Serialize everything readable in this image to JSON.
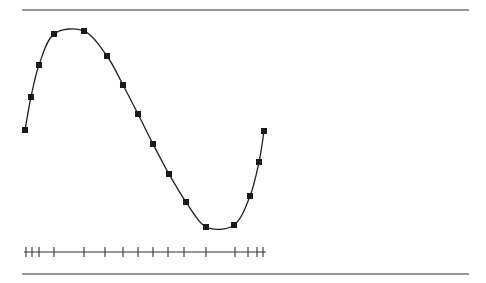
{
  "chart_data": {
    "type": "line",
    "title": "",
    "xlabel": "",
    "ylabel": "",
    "grid": false,
    "legend": null,
    "points_px": [
      {
        "x": 25,
        "y": 130
      },
      {
        "x": 31,
        "y": 97
      },
      {
        "x": 39,
        "y": 65
      },
      {
        "x": 54,
        "y": 34
      },
      {
        "x": 84,
        "y": 31
      },
      {
        "x": 107,
        "y": 56
      },
      {
        "x": 123,
        "y": 85
      },
      {
        "x": 138,
        "y": 114
      },
      {
        "x": 153,
        "y": 144
      },
      {
        "x": 169,
        "y": 174
      },
      {
        "x": 186,
        "y": 202
      },
      {
        "x": 206,
        "y": 227
      },
      {
        "x": 234,
        "y": 225
      },
      {
        "x": 250,
        "y": 196
      },
      {
        "x": 259,
        "y": 162
      },
      {
        "x": 264,
        "y": 131
      }
    ],
    "x_ticks_px": [
      26,
      32,
      39,
      54,
      84,
      105,
      123,
      138,
      153,
      168,
      184,
      206,
      235,
      248,
      257,
      263
    ],
    "x_tick_labels": [],
    "curve_extrema_px": {
      "max": {
        "x": 69,
        "y": 23
      },
      "min": {
        "x": 221,
        "y": 233
      }
    },
    "normalized_values": [
      0.0,
      0.32,
      0.62,
      0.91,
      0.94,
      0.7,
      0.43,
      0.15,
      -0.14,
      -0.42,
      -0.69,
      -0.93,
      -0.91,
      -0.63,
      -0.3,
      -0.01
    ],
    "ylim": [
      -1,
      1
    ]
  },
  "layout": {
    "top_rule": {
      "x1": 22,
      "x2": 469,
      "y": 10
    },
    "bottom_rule": {
      "x1": 22,
      "x2": 469,
      "y": 274
    },
    "axis": {
      "x1": 24,
      "x2": 266,
      "y": 252,
      "tick_half_height": 5
    },
    "marker_size": 6,
    "colors": {
      "line": "#222222",
      "marker": "#1a1a1a",
      "rule": "#333333",
      "background": "#ffffff"
    }
  }
}
